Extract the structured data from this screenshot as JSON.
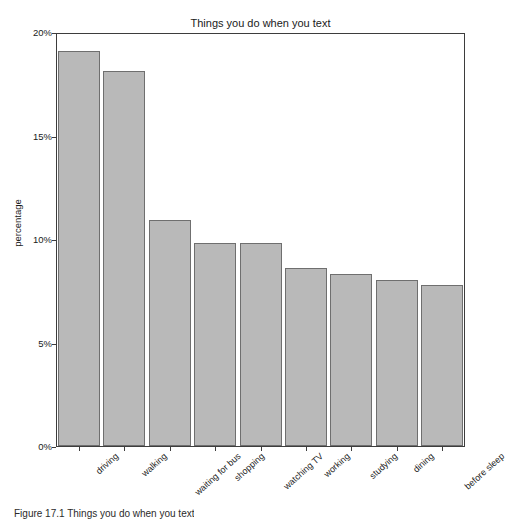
{
  "chart_data": {
    "type": "bar",
    "title": "Things you do when you text",
    "xlabel": "",
    "ylabel": "percentage",
    "categories": [
      "driving",
      "walking",
      "waiting for bus",
      "shopping",
      "watching TV",
      "working",
      "studying",
      "dining",
      "before sleep"
    ],
    "values": [
      19.1,
      18.1,
      10.9,
      9.8,
      9.8,
      8.6,
      8.3,
      8.0,
      7.8
    ],
    "ylim": [
      0,
      20
    ],
    "yticks": [
      "0%",
      "5%",
      "10%",
      "15%",
      "20%"
    ],
    "ytick_values": [
      0,
      5,
      10,
      15,
      20
    ],
    "grid": false,
    "legend": null,
    "bar_color": "#b9b9b9",
    "bar_edge_color": "#6f6f6f",
    "axis_color": "#3d3d3d"
  },
  "caption": {
    "text": "Figure 17.1  Things you do when you text"
  }
}
